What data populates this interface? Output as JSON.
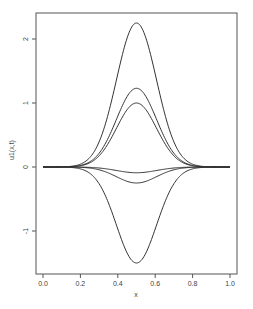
{
  "chart_data": {
    "type": "line",
    "title": "",
    "xlabel": "x",
    "ylabel": "u1(x,t)",
    "xlim": [
      0.0,
      1.0
    ],
    "ylim": [
      -1.6,
      2.35
    ],
    "xticks": [
      "0.0",
      "0.2",
      "0.4",
      "0.6",
      "0.8",
      "1.0"
    ],
    "yticks": [
      "-1",
      "0",
      "1",
      "2"
    ],
    "grid": false,
    "legend": null,
    "line_color": "#333333",
    "series": [
      {
        "name": "curve-1",
        "peak_x": 0.5,
        "amplitude": 2.25,
        "sigma": 0.107
      },
      {
        "name": "curve-2",
        "peak_x": 0.5,
        "amplitude": 1.23,
        "sigma": 0.107
      },
      {
        "name": "curve-3",
        "peak_x": 0.5,
        "amplitude": 1.0,
        "sigma": 0.107
      },
      {
        "name": "curve-4",
        "peak_x": 0.5,
        "amplitude": -0.09,
        "sigma": 0.107
      },
      {
        "name": "curve-5",
        "peak_x": 0.5,
        "amplitude": -0.25,
        "sigma": 0.107
      },
      {
        "name": "curve-6",
        "peak_x": 0.5,
        "amplitude": -1.5,
        "sigma": 0.107
      }
    ],
    "sample_points": {
      "x": [
        0.0,
        0.1,
        0.2,
        0.3,
        0.4,
        0.5,
        0.6,
        0.7,
        0.8,
        0.9,
        1.0
      ],
      "curve-1": [
        0.0,
        0.0,
        0.05,
        0.39,
        1.45,
        2.25,
        1.45,
        0.39,
        0.05,
        0.0,
        0.0
      ],
      "curve-6": [
        0.0,
        0.0,
        -0.03,
        -0.26,
        -0.97,
        -1.5,
        -0.97,
        -0.26,
        -0.03,
        0.0,
        0.0
      ]
    }
  }
}
